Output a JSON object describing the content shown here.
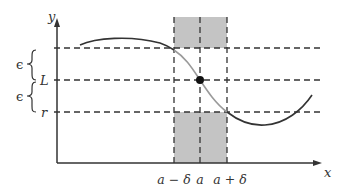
{
  "diagram": {
    "colors": {
      "axis": "#333333",
      "dashed": "#333333",
      "shade": "#c4c4c4",
      "curve": "#333333",
      "curve_highlight": "#9a9a9a",
      "point": "#111111"
    },
    "axes": {
      "x_label": "x",
      "y_label": "y"
    },
    "y_levels": {
      "upper_label": "",
      "L_label": "L",
      "r_label": "r"
    },
    "epsilon_labels": [
      "ϵ",
      "ϵ"
    ],
    "x_ticks": {
      "a_minus_delta": "a − δ",
      "a": "a",
      "a_plus_delta": "a + δ"
    },
    "shaded_regions": [
      {
        "name": "upper",
        "x_from": "a−δ",
        "x_to": "a+δ",
        "y_above": "L+ϵ"
      },
      {
        "name": "lower",
        "x_from": "a−δ",
        "x_to": "a+δ",
        "y_below": "L−ϵ"
      }
    ],
    "point": {
      "x": "a",
      "y": "L",
      "filled": true
    }
  }
}
